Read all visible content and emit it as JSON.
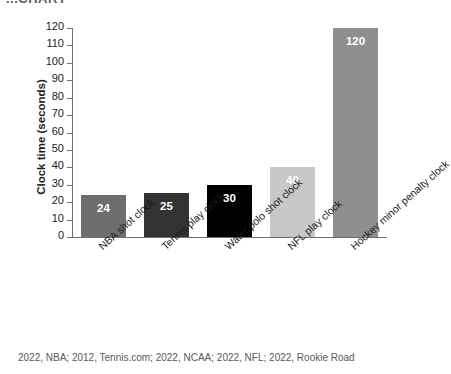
{
  "header_fragment": "...CHART",
  "source_note": "2022, NBA; 2012, Tennis.com; 2022, NCAA; 2022, NFL; 2022, Rookie Road",
  "chart_data": {
    "type": "bar",
    "title": "",
    "xlabel": "",
    "ylabel": "Clock time (seconds)",
    "ylim": [
      0,
      120
    ],
    "yticks": [
      0,
      10,
      20,
      30,
      40,
      50,
      60,
      70,
      80,
      90,
      100,
      110,
      120
    ],
    "grid": false,
    "legend": "none",
    "categories": [
      "NBA shot clock",
      "Tennis play clock",
      "Water polo shot clock",
      "NFL play clock",
      "Hockey minor penalty clock"
    ],
    "values": [
      24,
      25,
      30,
      40,
      120
    ],
    "value_labels": [
      "24",
      "25",
      "30",
      "40",
      "120"
    ],
    "bar_colors": [
      "#6e6e6e",
      "#333333",
      "#000000",
      "#c8c8c8",
      "#8f8f8f"
    ],
    "value_label_color": "#ffffff",
    "axis_color": "#6f6f6f"
  }
}
